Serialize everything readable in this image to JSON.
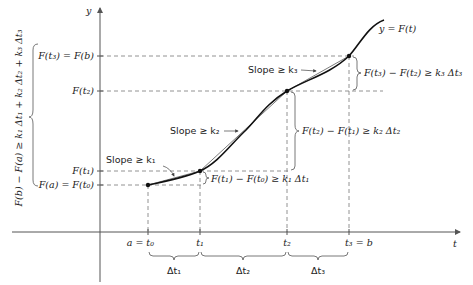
{
  "axes": {
    "y_label": "y",
    "x_label": "t"
  },
  "curve_label": "y = F(t)",
  "y_ticks": [
    {
      "label": "F(a) = F(t₀)"
    },
    {
      "label": "F(t₁)"
    },
    {
      "label": "F(t₂)"
    },
    {
      "label": "F(t₃) = F(b)"
    }
  ],
  "x_ticks": [
    {
      "label": "a = t₀"
    },
    {
      "label": "t₁"
    },
    {
      "label": "t₂"
    },
    {
      "label": "t₃ = b"
    }
  ],
  "intervals": [
    {
      "label": "Δt₁"
    },
    {
      "label": "Δt₂"
    },
    {
      "label": "Δt₃"
    }
  ],
  "slopes": [
    {
      "label": "Slope ≥ k₁"
    },
    {
      "label": "Slope ≥ k₂"
    },
    {
      "label": "Slope ≥ k₃"
    }
  ],
  "differences": [
    {
      "label": "F(t₁) − F(t₀) ≥ k₁ Δt₁"
    },
    {
      "label": "F(t₂) − F(t₁) ≥ k₂ Δt₂"
    },
    {
      "label": "F(t₃) − F(t₂) ≥ k₃ Δt₃"
    }
  ],
  "total_inequality": "F(b) − F(a) ≥ k₁ Δt₁ + k₂ Δt₂ + k₃ Δt₃"
}
